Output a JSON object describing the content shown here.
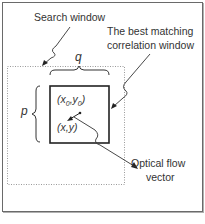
{
  "labels": {
    "search_window": "Search window",
    "best_match_line1": "The best matching",
    "best_match_line2": "correlation window",
    "q": "q",
    "p": "p",
    "origin_point": "(x0,y0)",
    "origin_x": "x",
    "origin_sub0": "0",
    "origin_y": "y",
    "current_point": "(x,y)",
    "optical_flow_line1": "Optical flow",
    "optical_flow_line2": "vector"
  },
  "caption": "(truncated caption)",
  "colors": {
    "line": "#2a2a2a",
    "dotted": "#9a9a9a",
    "frame": "#6a6a6a"
  }
}
